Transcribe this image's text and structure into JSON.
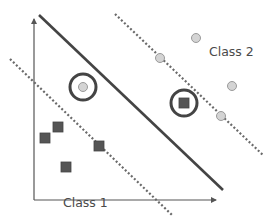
{
  "diagram": {
    "labels": {
      "class1": "Class 1",
      "class2": "Class 2"
    },
    "colors": {
      "axis": "#555555",
      "hyperplane": "#444444",
      "margin": "#6a6a6a",
      "square_fill": "#555555",
      "circle_fill": "#d4d4d4",
      "circle_stroke": "#9a9a9a",
      "ring": "#444444"
    },
    "axes": {
      "y_axis": {
        "x1": 34,
        "y1": 200,
        "x2": 34,
        "y2": 19
      },
      "x_axis": {
        "x1": 34,
        "y1": 200,
        "x2": 216,
        "y2": 200
      }
    },
    "hyperplane": {
      "x1": 39,
      "y1": 15,
      "x2": 223,
      "y2": 190
    },
    "margins": [
      {
        "name": "upper-margin",
        "x1": 115,
        "y1": 14,
        "x2": 264,
        "y2": 156
      },
      {
        "name": "lower-margin",
        "x1": 10,
        "y1": 59,
        "x2": 172,
        "y2": 215
      }
    ],
    "class1_points": [
      {
        "x": 45,
        "y": 138
      },
      {
        "x": 58,
        "y": 127
      },
      {
        "x": 66,
        "y": 167
      },
      {
        "x": 99,
        "y": 146
      }
    ],
    "class2_points": [
      {
        "x": 196,
        "y": 38
      },
      {
        "x": 232,
        "y": 86
      },
      {
        "x": 160,
        "y": 58
      },
      {
        "x": 221,
        "y": 116
      }
    ],
    "misclassified": [
      {
        "shape": "circle",
        "x": 83,
        "y": 87,
        "ring_r": 13
      },
      {
        "shape": "square",
        "x": 184,
        "y": 103,
        "ring_r": 13
      }
    ],
    "label_positions": {
      "class1": {
        "left": 63,
        "top": 197
      },
      "class2": {
        "left": 209,
        "top": 46
      }
    }
  }
}
